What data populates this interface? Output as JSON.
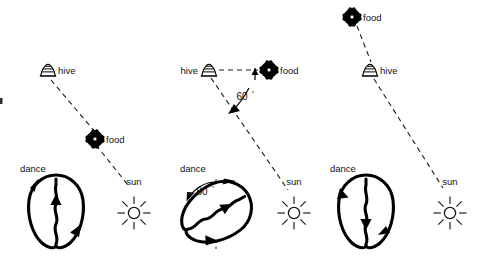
{
  "figure": {
    "background_color": "#ffffff",
    "ink_color": "#000000",
    "width": 493,
    "height": 266
  },
  "panels": [
    {
      "id": "panel-food-toward-sun",
      "labels": {
        "hive": "hive",
        "food": "food",
        "sun": "sun",
        "dance": "dance"
      },
      "angle": null,
      "description": "Food lies directly between hive and sun; waggle run points straight up."
    },
    {
      "id": "panel-food-60-degrees",
      "labels": {
        "hive": "hive",
        "food": "food",
        "sun": "sun",
        "dance": "dance",
        "field_angle": "60",
        "field_angle_unit": "°",
        "dance_angle": "60",
        "dance_angle_unit": "°"
      },
      "angle": 60,
      "description": "Food lies 60 degrees from the direction of the sun; waggle run is tilted 60 degrees from vertical."
    },
    {
      "id": "panel-food-away-from-sun",
      "labels": {
        "food": "food",
        "hive": "hive",
        "sun": "sun",
        "dance": "dance"
      },
      "angle": 180,
      "description": "Food lies directly away from the sun; waggle run points straight down."
    }
  ],
  "icons": {
    "hive": "hive-icon",
    "food": "flower-icon",
    "sun": "sun-icon",
    "dance": "figure-eight-dance-icon"
  },
  "colors": {
    "ink": "#000000",
    "dashed_line": "#1a1a1a",
    "background": "#ffffff"
  }
}
